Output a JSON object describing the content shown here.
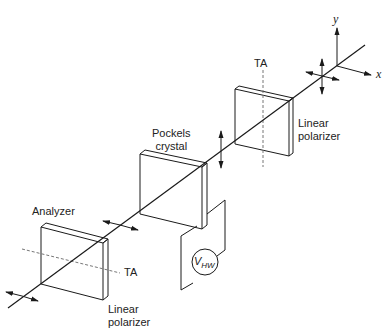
{
  "diagram": {
    "type": "optical-setup",
    "axes": {
      "x_label": "x",
      "y_label": "y"
    },
    "components": [
      {
        "id": "input-polarizer",
        "label": "Linear\npolarizer",
        "line1": "Linear",
        "line2": "polarizer",
        "axis_label": "TA"
      },
      {
        "id": "pockels-crystal",
        "label": "Pockels\ncrystal",
        "line1": "Pockels",
        "line2": "crystal"
      },
      {
        "id": "analyzer",
        "label": "Analyzer",
        "sublabel_line1": "Linear",
        "sublabel_line2": "polarizer",
        "axis_label": "TA"
      }
    ],
    "voltage_source": {
      "symbol": "V",
      "subscript": "HW"
    },
    "colors": {
      "line": "#1a1a1a",
      "dash": "#666666",
      "background": "#ffffff"
    }
  }
}
